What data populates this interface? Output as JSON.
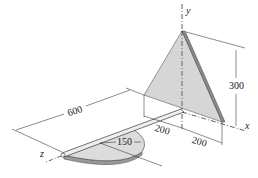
{
  "figure": {
    "type": "engineering-isometric-diagram",
    "axes": {
      "x": "x",
      "y": "y",
      "z": "z"
    },
    "dimensions": {
      "rod_length": "600",
      "disk_radius": "150",
      "triangle_offset_z": "200",
      "triangle_half_base_x": "200",
      "triangle_height": "300"
    },
    "colors": {
      "plate_fill": "#d6d6d6",
      "plate_edge": "#8a8a8a",
      "line": "#1a1a1a"
    }
  }
}
